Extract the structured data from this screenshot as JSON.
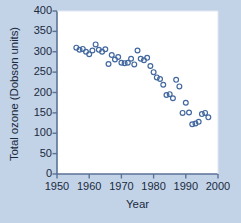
{
  "figure": {
    "background_color": "#c2d3e8",
    "plot_background_color": "#ffffff",
    "axis_color": "#5b7296",
    "text_color": "#1b2a3d",
    "marker_color": "#43689f"
  },
  "chart_data": {
    "type": "scatter",
    "title": "",
    "xlabel": "Year",
    "ylabel": "Total ozone (Dobson units)",
    "xlim": [
      1950,
      2000
    ],
    "ylim": [
      0,
      400
    ],
    "xticks": [
      1950,
      1960,
      1970,
      1980,
      1990,
      2000
    ],
    "yticks": [
      0,
      50,
      100,
      150,
      200,
      250,
      300,
      350,
      400
    ],
    "xtick_labels": [
      "1950",
      "1960",
      "1970",
      "1980",
      "1990",
      "2000"
    ],
    "ytick_labels": [
      "0",
      "50",
      "100",
      "150",
      "200",
      "250",
      "300",
      "350",
      "400"
    ],
    "grid": false,
    "legend": null,
    "marker": "open-circle",
    "series": [
      {
        "name": "Total ozone",
        "x": [
          1956,
          1957,
          1958,
          1959,
          1960,
          1961,
          1962,
          1963,
          1964,
          1965,
          1966,
          1967,
          1968,
          1969,
          1970,
          1971,
          1972,
          1973,
          1974,
          1975,
          1976,
          1977,
          1978,
          1979,
          1980,
          1981,
          1982,
          1983,
          1984,
          1985,
          1986,
          1987,
          1988,
          1989,
          1990,
          1991,
          1992,
          1993,
          1994,
          1995,
          1996,
          1997
        ],
        "y": [
          310,
          305,
          307,
          300,
          294,
          303,
          318,
          305,
          300,
          306,
          270,
          292,
          281,
          287,
          273,
          272,
          273,
          283,
          269,
          303,
          283,
          279,
          285,
          265,
          250,
          237,
          233,
          219,
          194,
          196,
          186,
          231,
          215,
          150,
          175,
          151,
          122,
          124,
          128,
          147,
          150,
          139
        ]
      }
    ]
  },
  "caption": {
    "partial_text": ""
  }
}
